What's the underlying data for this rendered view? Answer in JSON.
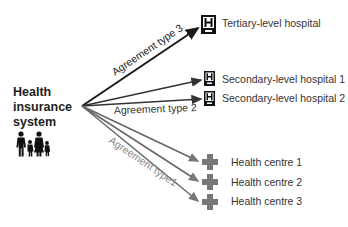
{
  "source": {
    "title_lines": [
      "Health",
      "insurance",
      "system"
    ],
    "icon": "family-icon"
  },
  "agreements": [
    {
      "label": "Agreement type 3",
      "color": "#1a1a1a"
    },
    {
      "label": "Agreement type 2",
      "color": "#333333"
    },
    {
      "label": "Agreement type1",
      "color": "#888888"
    }
  ],
  "targets": [
    {
      "label": "Tertiary-level hospital",
      "icon": "hospital-icon",
      "agreement": 3
    },
    {
      "label": "Secondary-level hospital 1",
      "icon": "hospital-icon",
      "agreement": 2
    },
    {
      "label": "Secondary-level hospital 2",
      "icon": "hospital-icon",
      "agreement": 2
    },
    {
      "label": "Health centre 1",
      "icon": "health-cross-icon",
      "agreement": 1
    },
    {
      "label": "Health centre 2",
      "icon": "health-cross-icon",
      "agreement": 1
    },
    {
      "label": "Health centre 3",
      "icon": "health-cross-icon",
      "agreement": 1
    }
  ]
}
